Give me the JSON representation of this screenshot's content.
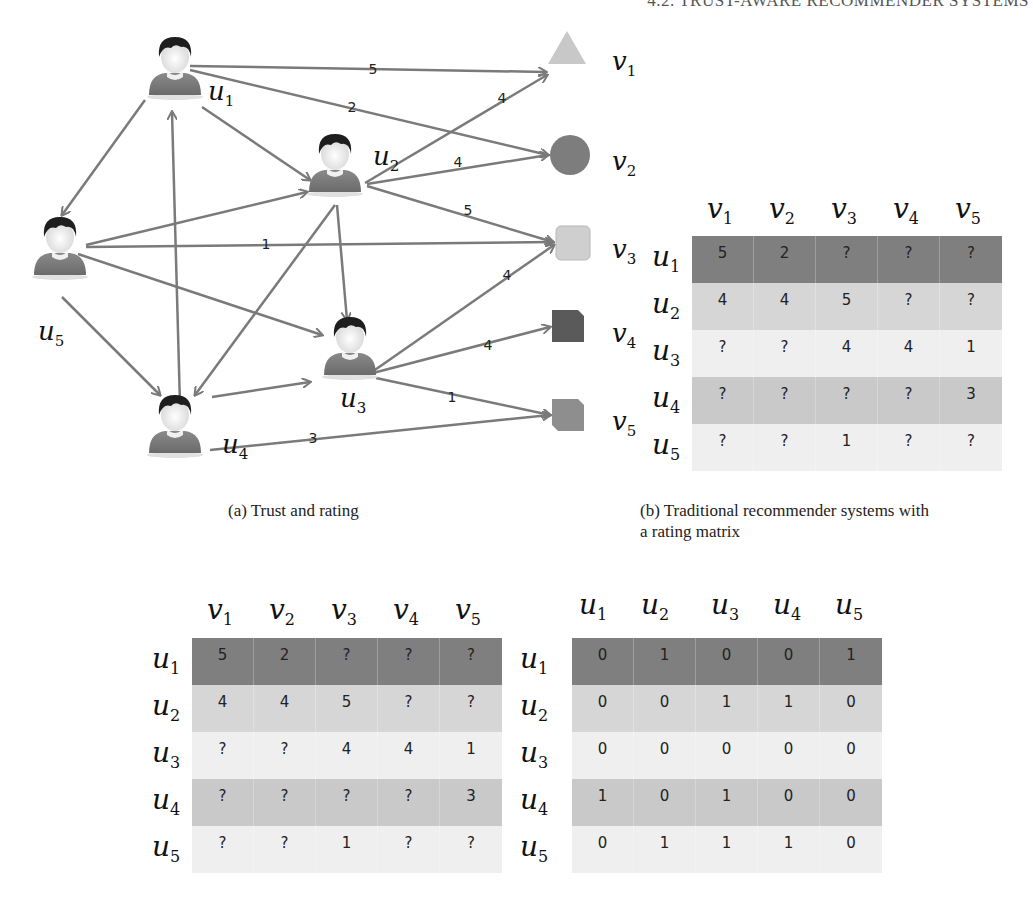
{
  "header": {
    "text": "4.2. TRUST-AWARE RECOMMENDER SYSTEMS"
  },
  "colors": {
    "edge": "#7a7a7a",
    "row_dark": "#7f7f7f",
    "row_light1": "#d6d6d6",
    "row_light2": "#efefef",
    "row_mid": "#c9c9c9",
    "item_v1": "#c8c8c8",
    "item_v2": "#7d7d7d",
    "item_v3": "#cfcfcf",
    "item_v4": "#5a5a5a",
    "item_v5": "#8e8e8e"
  },
  "graph": {
    "users": [
      {
        "id": "u1",
        "base": "u",
        "sub": "1",
        "x": 175,
        "y": 75,
        "lx": 208,
        "ly": 100
      },
      {
        "id": "u2",
        "base": "u",
        "sub": "2",
        "x": 335,
        "y": 172,
        "lx": 373,
        "ly": 165
      },
      {
        "id": "u3",
        "base": "u",
        "sub": "3",
        "x": 350,
        "y": 355,
        "lx": 340,
        "ly": 407
      },
      {
        "id": "u4",
        "base": "u",
        "sub": "4",
        "x": 175,
        "y": 433,
        "lx": 222,
        "ly": 453
      },
      {
        "id": "u5",
        "base": "u",
        "sub": "5",
        "x": 60,
        "y": 255,
        "lx": 38,
        "ly": 340
      }
    ],
    "items": [
      {
        "id": "v1",
        "base": "v",
        "sub": "1",
        "shape": "triangle",
        "x": 567,
        "y": 52,
        "lx": 612,
        "ly": 70
      },
      {
        "id": "v2",
        "base": "v",
        "sub": "2",
        "shape": "circle",
        "x": 570,
        "y": 155,
        "lx": 612,
        "ly": 170
      },
      {
        "id": "v3",
        "base": "v",
        "sub": "3",
        "shape": "rounded-square",
        "x": 573,
        "y": 243,
        "lx": 612,
        "ly": 258
      },
      {
        "id": "v4",
        "base": "v",
        "sub": "4",
        "shape": "cut-square-dark",
        "x": 568,
        "y": 326,
        "lx": 612,
        "ly": 342
      },
      {
        "id": "v5",
        "base": "v",
        "sub": "5",
        "shape": "cut-square",
        "x": 568,
        "y": 415,
        "lx": 612,
        "ly": 430
      }
    ],
    "trust_edges": [
      {
        "from": "u1",
        "to": "u5",
        "x1": 145,
        "y1": 100,
        "x2": 62,
        "y2": 215
      },
      {
        "from": "u1",
        "to": "u2",
        "x1": 202,
        "y1": 107,
        "x2": 310,
        "y2": 180
      },
      {
        "from": "u4",
        "to": "u1",
        "x1": 180,
        "y1": 405,
        "x2": 172,
        "y2": 112
      },
      {
        "from": "u5",
        "to": "u2",
        "x1": 86,
        "y1": 245,
        "x2": 307,
        "y2": 192
      },
      {
        "from": "u5",
        "to": "u3",
        "x1": 78,
        "y1": 254,
        "x2": 322,
        "y2": 335
      },
      {
        "from": "u5",
        "to": "u4",
        "x1": 62,
        "y1": 297,
        "x2": 160,
        "y2": 395
      },
      {
        "from": "u2",
        "to": "u4",
        "x1": 335,
        "y1": 205,
        "x2": 195,
        "y2": 395
      },
      {
        "from": "u2",
        "to": "u3",
        "x1": 337,
        "y1": 205,
        "x2": 347,
        "y2": 320
      },
      {
        "from": "u4",
        "to": "u3",
        "x1": 212,
        "y1": 397,
        "x2": 310,
        "y2": 382
      }
    ],
    "rating_edges": [
      {
        "from": "u1",
        "to": "v1",
        "rating": "5",
        "x1": 190,
        "y1": 66,
        "x2": 546,
        "y2": 72,
        "tx": 373,
        "ty": 74
      },
      {
        "from": "u1",
        "to": "v2",
        "rating": "2",
        "x1": 190,
        "y1": 70,
        "x2": 548,
        "y2": 155,
        "tx": 352,
        "ty": 112
      },
      {
        "from": "u2",
        "to": "v1",
        "rating": "4",
        "x1": 365,
        "y1": 183,
        "x2": 547,
        "y2": 75,
        "tx": 502,
        "ty": 103
      },
      {
        "from": "u2",
        "to": "v2",
        "rating": "4",
        "x1": 367,
        "y1": 184,
        "x2": 548,
        "y2": 155,
        "tx": 458,
        "ty": 167
      },
      {
        "from": "u2",
        "to": "v3",
        "rating": "5",
        "x1": 367,
        "y1": 186,
        "x2": 553,
        "y2": 242,
        "tx": 468,
        "ty": 215
      },
      {
        "from": "u5",
        "to": "v3",
        "rating": "1",
        "x1": 86,
        "y1": 247,
        "x2": 553,
        "y2": 242,
        "tx": 266,
        "ty": 249
      },
      {
        "from": "u3",
        "to": "v3",
        "rating": "4",
        "x1": 372,
        "y1": 372,
        "x2": 554,
        "y2": 245,
        "tx": 507,
        "ty": 280
      },
      {
        "from": "u3",
        "to": "v4",
        "rating": "4",
        "x1": 373,
        "y1": 373,
        "x2": 550,
        "y2": 327,
        "tx": 488,
        "ty": 350
      },
      {
        "from": "u3",
        "to": "v5",
        "rating": "1",
        "x1": 376,
        "y1": 378,
        "x2": 550,
        "y2": 415,
        "tx": 452,
        "ty": 402
      },
      {
        "from": "u4",
        "to": "v5",
        "rating": "3",
        "x1": 210,
        "y1": 450,
        "x2": 550,
        "y2": 415,
        "tx": 313,
        "ty": 443
      }
    ]
  },
  "captions": {
    "a": "(a)  Trust and rating",
    "b_line1": "(b)  Traditional recommender systems with",
    "b_line2": "a rating matrix"
  },
  "matrices": {
    "rating_top": {
      "col_headers": [
        {
          "base": "v",
          "sub": "1"
        },
        {
          "base": "v",
          "sub": "2"
        },
        {
          "base": "v",
          "sub": "3"
        },
        {
          "base": "v",
          "sub": "4"
        },
        {
          "base": "v",
          "sub": "5"
        }
      ],
      "row_headers": [
        {
          "base": "u",
          "sub": "1"
        },
        {
          "base": "u",
          "sub": "2"
        },
        {
          "base": "u",
          "sub": "3"
        },
        {
          "base": "u",
          "sub": "4"
        },
        {
          "base": "u",
          "sub": "5"
        }
      ],
      "rows": [
        [
          "5",
          "2",
          "?",
          "?",
          "?"
        ],
        [
          "4",
          "4",
          "5",
          "?",
          "?"
        ],
        [
          "?",
          "?",
          "4",
          "4",
          "1"
        ],
        [
          "?",
          "?",
          "?",
          "?",
          "3"
        ],
        [
          "?",
          "?",
          "1",
          "?",
          "?"
        ]
      ]
    },
    "rating_bottom": {
      "col_headers": [
        {
          "base": "v",
          "sub": "1"
        },
        {
          "base": "v",
          "sub": "2"
        },
        {
          "base": "v",
          "sub": "3"
        },
        {
          "base": "v",
          "sub": "4"
        },
        {
          "base": "v",
          "sub": "5"
        }
      ],
      "row_headers": [
        {
          "base": "u",
          "sub": "1"
        },
        {
          "base": "u",
          "sub": "2"
        },
        {
          "base": "u",
          "sub": "3"
        },
        {
          "base": "u",
          "sub": "4"
        },
        {
          "base": "u",
          "sub": "5"
        }
      ],
      "rows": [
        [
          "5",
          "2",
          "?",
          "?",
          "?"
        ],
        [
          "4",
          "4",
          "5",
          "?",
          "?"
        ],
        [
          "?",
          "?",
          "4",
          "4",
          "1"
        ],
        [
          "?",
          "?",
          "?",
          "?",
          "3"
        ],
        [
          "?",
          "?",
          "1",
          "?",
          "?"
        ]
      ]
    },
    "trust_bottom": {
      "col_headers": [
        {
          "base": "u",
          "sub": "1"
        },
        {
          "base": "u",
          "sub": "2"
        },
        {
          "base": "u",
          "sub": "3"
        },
        {
          "base": "u",
          "sub": "4"
        },
        {
          "base": "u",
          "sub": "5"
        }
      ],
      "row_headers": [
        {
          "base": "u",
          "sub": "1"
        },
        {
          "base": "u",
          "sub": "2"
        },
        {
          "base": "u",
          "sub": "3"
        },
        {
          "base": "u",
          "sub": "4"
        },
        {
          "base": "u",
          "sub": "5"
        }
      ],
      "rows": [
        [
          "0",
          "1",
          "0",
          "0",
          "1"
        ],
        [
          "0",
          "0",
          "1",
          "1",
          "0"
        ],
        [
          "0",
          "0",
          "0",
          "0",
          "0"
        ],
        [
          "1",
          "0",
          "1",
          "0",
          "0"
        ],
        [
          "0",
          "1",
          "1",
          "1",
          "0"
        ]
      ]
    }
  }
}
